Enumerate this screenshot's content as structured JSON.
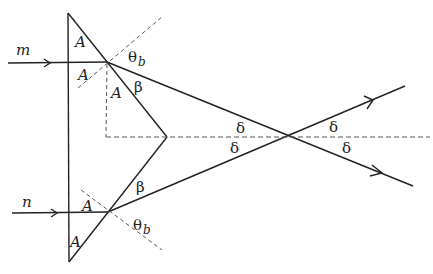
{
  "diagram": {
    "type": "optics-prism-ray-diagram",
    "colors": {
      "line": "#222222",
      "dashed": "#555555",
      "background": "#ffffff"
    },
    "labels": {
      "ray_m": "m",
      "ray_n": "n",
      "angle_A": "A",
      "theta": "θ",
      "theta_sub": "b",
      "beta": "β",
      "delta": "δ"
    },
    "prism": {
      "top_vertex": [
        68,
        13
      ],
      "bottom_vertex": [
        69,
        262
      ],
      "apex": [
        167,
        137
      ]
    },
    "rays": [
      {
        "name": "m",
        "start": [
          8,
          63
        ],
        "entry": [
          107,
          62
        ],
        "exit_end": [
          413,
          186
        ]
      },
      {
        "name": "n",
        "start": [
          12,
          213
        ],
        "entry": [
          108,
          212
        ],
        "exit_end": [
          405,
          86
        ]
      }
    ],
    "crossing_point": [
      287,
      137
    ],
    "axis_dashed": {
      "start": [
        105,
        137
      ],
      "end": [
        430,
        137
      ]
    }
  }
}
